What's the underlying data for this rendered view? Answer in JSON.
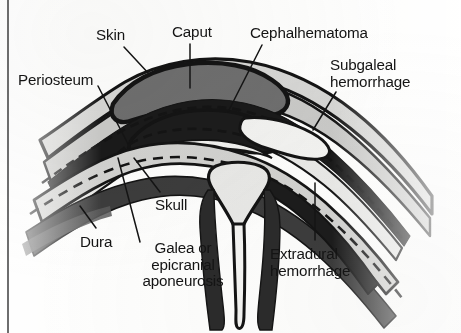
{
  "figure": {
    "background_color": "#fdfdfc",
    "ink_color": "#141414",
    "page_border_color": "#4a4a4a"
  },
  "labels": [
    {
      "id": "skin",
      "text": "Skin",
      "x": 96,
      "y": 27,
      "align": "left",
      "leader": "line from label down-right to outer scalp surface"
    },
    {
      "id": "caput",
      "text": "Caput",
      "x": 172,
      "y": 24,
      "align": "left",
      "leader": "vertical line down into caput succedaneum mass"
    },
    {
      "id": "cephalhematoma",
      "text": "Cephalhematoma",
      "x": 250,
      "y": 25,
      "align": "left",
      "leader": "line down-left into subperiosteal blood collection"
    },
    {
      "id": "subgaleal-hemorrhage",
      "line1": "Subgaleal",
      "line2": "hemorrhage",
      "x": 330,
      "y": 57,
      "align": "left",
      "leader": "line down-left to subgaleal space"
    },
    {
      "id": "periosteum",
      "text": "Periosteum",
      "x": 18,
      "y": 72,
      "align": "left",
      "leader": "line down-right to dashed periosteal layer"
    },
    {
      "id": "skull",
      "text": "Skull",
      "x": 155,
      "y": 197,
      "align": "left",
      "leader": "line up-left into cranial bone band"
    },
    {
      "id": "dura",
      "text": "Dura",
      "x": 80,
      "y": 234,
      "align": "left",
      "leader": "line up-right to dura mater layer"
    },
    {
      "id": "galea",
      "line1": "Galea or",
      "line2": "epicranial",
      "line3": "aponeurosis",
      "x": 124,
      "y": 240,
      "align": "center",
      "leader": "line up-left to galea aponeurotica layer"
    },
    {
      "id": "extradural-hemorrhage",
      "line1": "Extradural",
      "line2": "hemorrhage",
      "x": 270,
      "y": 246,
      "align": "left",
      "leader": "vertical line up into extradural space"
    }
  ],
  "anatomy": {
    "layers": [
      {
        "name": "skin",
        "fill": "#d6d6d4",
        "stroke": "#141414"
      },
      {
        "name": "subcutaneous-tissue",
        "fill": "#c9c9c7",
        "stroke": "#141414"
      },
      {
        "name": "galea-aponeurotica",
        "fill": "#1a1a1a",
        "stroke": "#141414"
      },
      {
        "name": "subgaleal-space",
        "fill": "#e8e8e6",
        "stroke": "#141414"
      },
      {
        "name": "periosteum",
        "fill": "none",
        "stroke": "#141414",
        "style": "dashed"
      },
      {
        "name": "skull-bone",
        "fill": "#d2d2d0",
        "stroke": "#141414"
      },
      {
        "name": "dura-mater",
        "fill": "none",
        "stroke": "#141414",
        "style": "dashed"
      },
      {
        "name": "caput-succedaneum",
        "fill": "#6e6e6e",
        "stroke": "#141414"
      },
      {
        "name": "cephalhematoma-blood",
        "fill": "#1c1c1c",
        "stroke": "#141414"
      },
      {
        "name": "extradural-blood",
        "fill": "#1c1c1c",
        "stroke": "#141414"
      },
      {
        "name": "sagittal-sinus",
        "fill": "#e8e8e6",
        "stroke": "#141414"
      },
      {
        "name": "falx-cerebri",
        "fill": "#f2f2f0",
        "stroke": "#141414"
      }
    ]
  }
}
